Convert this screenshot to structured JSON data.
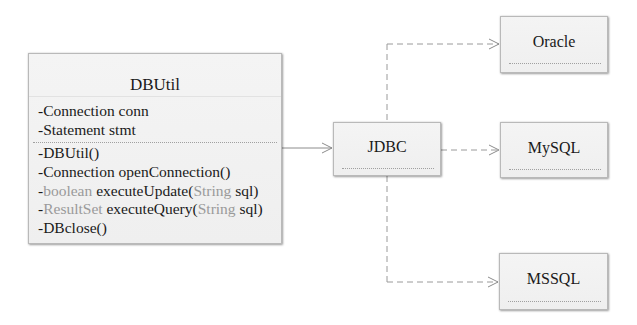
{
  "diagram": {
    "type": "UML class diagram",
    "classes": {
      "dbutil": {
        "name": "DBUtil",
        "attributes": [
          {
            "visibility": "-",
            "type": "Connection",
            "name": "conn"
          },
          {
            "visibility": "-",
            "type": "Statement",
            "name": "stmt"
          }
        ],
        "operations": [
          {
            "visibility": "-",
            "type": "",
            "name": "DBUtil()",
            "param_type": "",
            "param_name": "",
            "close": ""
          },
          {
            "visibility": "-",
            "type": "Connection ",
            "name": "openConnection()",
            "param_type": "",
            "param_name": "",
            "close": ""
          },
          {
            "visibility": "-",
            "type": "boolean",
            "name": " executeUpdate(",
            "param_type": "String",
            "param_name": " sql",
            "close": ")"
          },
          {
            "visibility": "-",
            "type": "ResultSet",
            "name": " executeQuery(",
            "param_type": "String",
            "param_name": " sql",
            "close": ")"
          },
          {
            "visibility": "-",
            "type": "",
            "name": "DBclose()",
            "param_type": "",
            "param_name": "",
            "close": ""
          }
        ]
      },
      "jdbc": {
        "name": "JDBC"
      },
      "oracle": {
        "name": "Oracle"
      },
      "mysql": {
        "name": "MySQL"
      },
      "mssql": {
        "name": "MSSQL"
      }
    },
    "relations": [
      {
        "from": "DBUtil",
        "to": "JDBC",
        "style": "solid",
        "arrow": "open"
      },
      {
        "from": "JDBC",
        "to": "Oracle",
        "style": "dashed",
        "arrow": "open"
      },
      {
        "from": "JDBC",
        "to": "MySQL",
        "style": "dashed",
        "arrow": "open"
      },
      {
        "from": "JDBC",
        "to": "MSSQL",
        "style": "dashed",
        "arrow": "open"
      }
    ],
    "colors": {
      "text": "#1a1a1a",
      "type_text": "#9a9a9a",
      "box_fill": "#f2f2f2",
      "box_border": "#b9b9b9",
      "connector": "#8c8c8c"
    }
  }
}
